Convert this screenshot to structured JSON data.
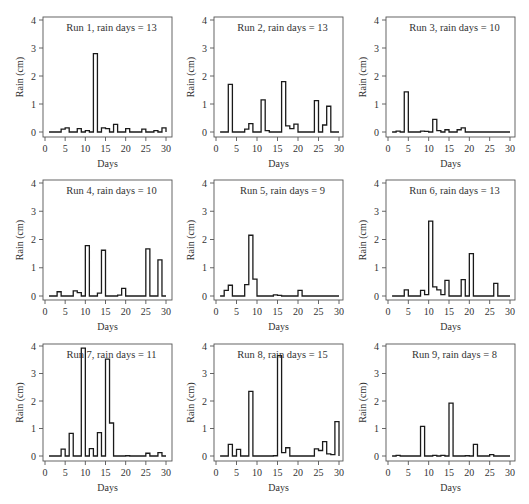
{
  "chart_data": {
    "type": "line",
    "layout": "3x3 grid of step plots",
    "shared": {
      "xlabel": "Days",
      "ylabel": "Rain (cm)",
      "xlim": [
        0,
        30
      ],
      "ylim": [
        0,
        4
      ],
      "xticks": [
        0,
        5,
        10,
        15,
        20,
        25,
        30
      ],
      "yticks": [
        0,
        1,
        2,
        3,
        4
      ],
      "grid": false,
      "legend": false,
      "step": "post",
      "x": [
        1,
        2,
        3,
        4,
        5,
        6,
        7,
        8,
        9,
        10,
        11,
        12,
        13,
        14,
        15,
        16,
        17,
        18,
        19,
        20,
        21,
        22,
        23,
        24,
        25,
        26,
        27,
        28,
        29,
        30
      ]
    },
    "panels": [
      {
        "title": "Run 1, rain days = 13",
        "values": [
          0,
          0,
          0,
          0.1,
          0.15,
          0,
          0,
          0.12,
          0,
          0.05,
          0,
          2.8,
          0,
          0.15,
          0.12,
          0,
          0.27,
          0,
          0,
          0.12,
          0,
          0,
          0,
          0.1,
          0,
          0,
          0.05,
          0,
          0.15,
          0
        ]
      },
      {
        "title": "Run 2, rain days = 13",
        "values": [
          0,
          0,
          1.7,
          0,
          0,
          0,
          0.1,
          0.3,
          0,
          0,
          1.15,
          0.05,
          0,
          0,
          0,
          1.8,
          0.22,
          0.12,
          0.28,
          0,
          0,
          0,
          0,
          1.12,
          0,
          0.25,
          0.92,
          0,
          0,
          0
        ]
      },
      {
        "title": "Run 3, rain days = 10",
        "values": [
          0,
          0.03,
          0,
          1.43,
          0,
          0,
          0,
          0.03,
          0.02,
          0,
          0.45,
          0.05,
          0,
          0.08,
          0,
          0,
          0.08,
          0.15,
          0,
          0,
          0,
          0,
          0,
          0,
          0,
          0,
          0,
          0,
          0,
          0
        ]
      },
      {
        "title": "Run 4, rain days = 10",
        "values": [
          0,
          0,
          0.15,
          0,
          0,
          0,
          0.18,
          0.12,
          0,
          1.78,
          0,
          0,
          0.1,
          1.62,
          0,
          0,
          0,
          0.03,
          0.27,
          0,
          0,
          0,
          0,
          0,
          1.67,
          0,
          0,
          1.28,
          0,
          0
        ]
      },
      {
        "title": "Run 5, rain days = 9",
        "values": [
          0,
          0.2,
          0.38,
          0,
          0,
          0,
          0.4,
          2.15,
          0.6,
          0,
          0,
          0,
          0,
          0.04,
          0.02,
          0,
          0,
          0,
          0,
          0.2,
          0,
          0,
          0,
          0,
          0,
          0,
          0,
          0,
          0,
          0
        ]
      },
      {
        "title": "Run 6, rain days = 13",
        "values": [
          0,
          0,
          0,
          0.22,
          0,
          0,
          0,
          0.2,
          0.05,
          2.65,
          0.32,
          0.22,
          0.05,
          0.55,
          0,
          0,
          0,
          0.58,
          0,
          1.5,
          0,
          0,
          0,
          0,
          0,
          0.45,
          0,
          0,
          0,
          0
        ]
      },
      {
        "title": "Run 7, rain days = 11",
        "values": [
          0,
          0,
          0,
          0.25,
          0,
          0.82,
          0,
          0,
          3.92,
          0,
          0.27,
          0,
          0.85,
          0,
          3.52,
          1.2,
          0,
          0,
          0,
          0.01,
          0,
          0,
          0,
          0,
          0.1,
          0,
          0,
          0.12,
          0,
          0
        ]
      },
      {
        "title": "Run 8, rain days = 15",
        "values": [
          0,
          0,
          0.42,
          0,
          0.24,
          0,
          0,
          2.35,
          0,
          0,
          0,
          0,
          0,
          0.01,
          3.65,
          0.12,
          0.3,
          0,
          0,
          0,
          0,
          0,
          0,
          0.26,
          0.2,
          0.52,
          0.08,
          0.05,
          1.25,
          0
        ]
      },
      {
        "title": "Run 9, rain days = 8",
        "values": [
          0,
          0.02,
          0,
          0,
          0,
          0,
          0,
          1.08,
          0,
          0,
          0.02,
          0,
          0.02,
          0,
          1.92,
          0,
          0,
          0,
          0.01,
          0,
          0.42,
          0,
          0,
          0,
          0.05,
          0,
          0,
          0,
          0,
          0
        ]
      }
    ]
  },
  "colors": {
    "line": "#1a1a1a",
    "frame": "#555555",
    "text": "#333333",
    "background": "#ffffff"
  }
}
